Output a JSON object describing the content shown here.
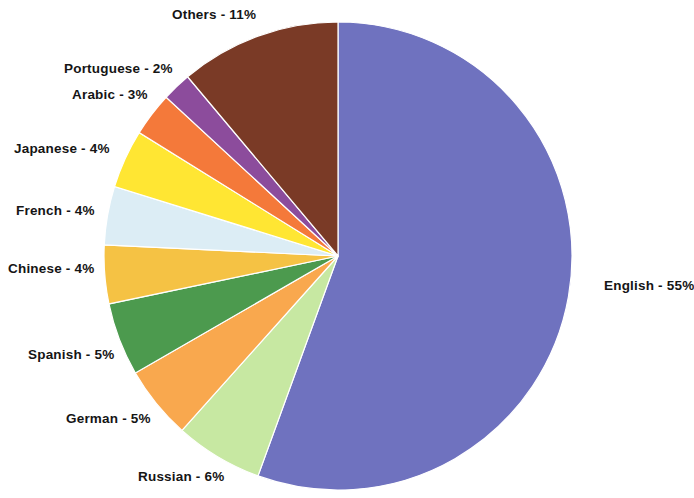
{
  "chart_data": {
    "type": "pie",
    "title": "",
    "subtitle": "",
    "xlabel": "",
    "ylabel": "",
    "legend_position": "none",
    "grid": false,
    "unit": "%",
    "labels": [
      "English",
      "Russian",
      "German",
      "Spanish",
      "Chinese",
      "French",
      "Japanese",
      "Arabic",
      "Portuguese",
      "Others"
    ],
    "values": [
      55,
      6,
      5,
      5,
      4,
      4,
      4,
      3,
      2,
      11
    ],
    "colors": [
      "#6f72bf",
      "#c7e8a2",
      "#f9a84e",
      "#4c9a4e",
      "#f5c244",
      "#dcedf5",
      "#ffe633",
      "#f4793a",
      "#8c4c9c",
      "#7a3a26"
    ],
    "slices": [
      {
        "label": "English",
        "value": 55,
        "text": "English  - 55%",
        "color": "#6f72bf"
      },
      {
        "label": "Russian",
        "value": 6,
        "text": "Russian - 6%",
        "color": "#c7e8a2"
      },
      {
        "label": "German",
        "value": 5,
        "text": "German  - 5%",
        "color": "#f9a84e"
      },
      {
        "label": "Spanish",
        "value": 5,
        "text": "Spanish - 5%",
        "color": "#4c9a4e"
      },
      {
        "label": "Chinese",
        "value": 4,
        "text": "Chinese - 4%",
        "color": "#f5c244"
      },
      {
        "label": "French",
        "value": 4,
        "text": "French  - 4%",
        "color": "#dcedf5"
      },
      {
        "label": "Japanese",
        "value": 4,
        "text": "Japanese  - 4%",
        "color": "#ffe633"
      },
      {
        "label": "Arabic",
        "value": 3,
        "text": "Arabic - 3%",
        "color": "#f4793a"
      },
      {
        "label": "Portuguese",
        "value": 2,
        "text": "Portuguese - 2%",
        "color": "#8c4c9c"
      },
      {
        "label": "Others",
        "value": 11,
        "text": "Others - 11%",
        "color": "#7a3a26"
      }
    ]
  },
  "labels": {
    "english": "English  - 55%",
    "russian": "Russian - 6%",
    "german": "German  - 5%",
    "spanish": "Spanish - 5%",
    "chinese": "Chinese - 4%",
    "french": "French  - 4%",
    "japanese": "Japanese  - 4%",
    "arabic": "Arabic - 3%",
    "portuguese": "Portuguese - 2%",
    "others": "Others - 11%"
  }
}
